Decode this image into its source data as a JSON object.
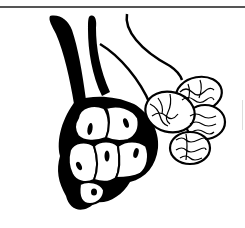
{
  "figure": {
    "colors": {
      "ink": "#000000",
      "background": "#ffffff",
      "rule": "#555555"
    }
  }
}
